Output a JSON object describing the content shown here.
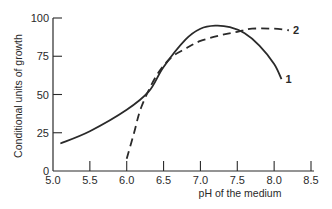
{
  "chart_data": {
    "type": "line",
    "title": "",
    "xlabel": "pH of the medium",
    "ylabel": "Conditional units of growth",
    "xlim": [
      5.0,
      8.5
    ],
    "ylim": [
      0,
      100
    ],
    "x_ticks": [
      "5.0",
      "5.5",
      "6.0",
      "6.5",
      "7.0",
      "7.5",
      "8.0",
      "8.5"
    ],
    "y_ticks": [
      "0",
      "25",
      "50",
      "75",
      "100"
    ],
    "grid": false,
    "legend": "inline curve labels at right end",
    "series": [
      {
        "name": "1",
        "style": "solid",
        "x": [
          5.1,
          5.5,
          6.0,
          6.3,
          6.5,
          6.8,
          7.0,
          7.2,
          7.4,
          7.6,
          7.8,
          8.0,
          8.1
        ],
        "y": [
          18,
          26,
          40,
          52,
          68,
          86,
          93,
          95,
          94,
          90,
          82,
          70,
          60
        ]
      },
      {
        "name": "2",
        "style": "dashed",
        "x": [
          6.0,
          6.1,
          6.2,
          6.4,
          6.6,
          6.8,
          7.0,
          7.3,
          7.5,
          7.7,
          8.0,
          8.2
        ],
        "y": [
          8,
          25,
          42,
          62,
          74,
          80,
          85,
          89,
          91,
          93,
          93,
          92
        ]
      }
    ]
  }
}
